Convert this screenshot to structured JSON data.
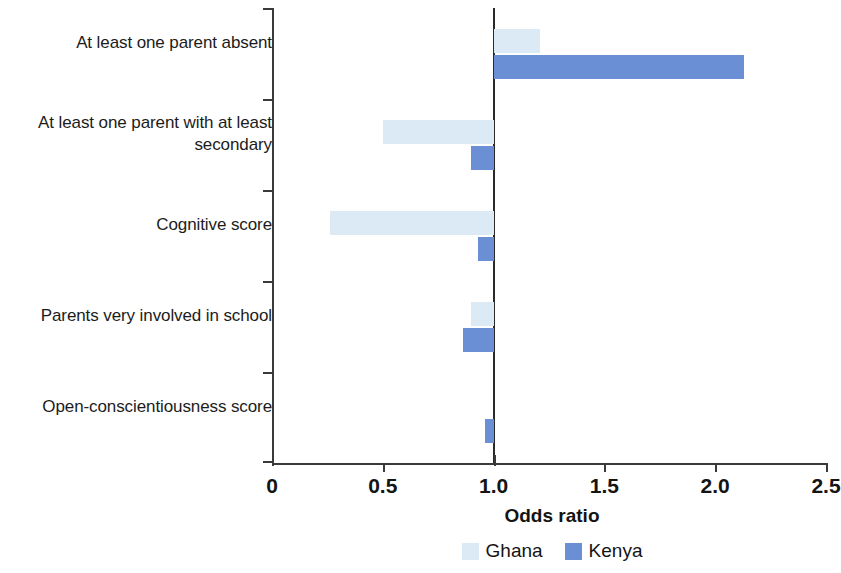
{
  "chart_data": {
    "type": "bar",
    "orientation": "horizontal",
    "title": "",
    "xlabel": "Odds ratio",
    "ylabel": "",
    "xlim": [
      0,
      2.5
    ],
    "xticks": [
      0,
      0.5,
      1.0,
      1.5,
      2.0,
      2.5
    ],
    "xtick_labels": [
      "0",
      "0.5",
      "1.0",
      "1.5",
      "2.0",
      "2.5"
    ],
    "reference_line": 1.0,
    "grid": false,
    "legend_position": "bottom",
    "categories": [
      "At least one parent absent",
      "At least one parent with at least secondary",
      "Cognitive score",
      "Parents very involved in school",
      "Open-conscientiousness score"
    ],
    "category_lines": [
      [
        "At least one parent absent"
      ],
      [
        "At least one parent with at least",
        "secondary"
      ],
      [
        "Cognitive score"
      ],
      [
        "Parents very involved in school"
      ],
      [
        "Open-conscientiousness score"
      ]
    ],
    "series": [
      {
        "name": "Ghana",
        "color": "#dbeaf5",
        "values": [
          1.21,
          0.5,
          0.26,
          0.9,
          1.0
        ]
      },
      {
        "name": "Kenya",
        "color": "#6b8fd4",
        "values": [
          2.13,
          0.9,
          0.93,
          0.86,
          0.96
        ]
      }
    ]
  },
  "legend": {
    "items": [
      {
        "label": "Ghana",
        "color": "#dbeaf5"
      },
      {
        "label": "Kenya",
        "color": "#6b8fd4"
      }
    ]
  },
  "axis": {
    "title": "Odds ratio"
  }
}
